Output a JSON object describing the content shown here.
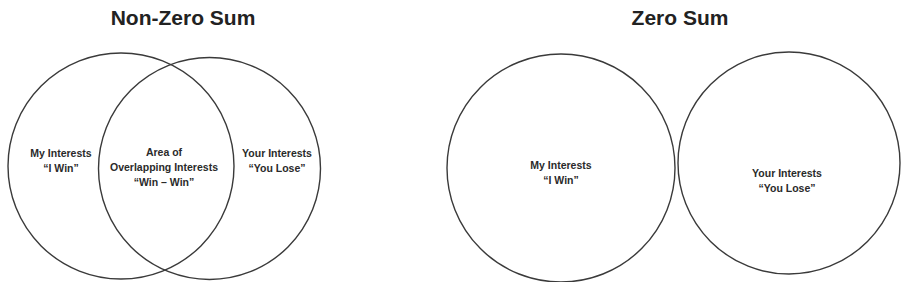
{
  "panels": [
    {
      "title": "Non-Zero Sum",
      "left_label": [
        "My Interests",
        "“I Win”"
      ],
      "overlap_label": [
        "Area of",
        "Overlapping Interests",
        "“Win – Win”"
      ],
      "right_label": [
        "Your Interests",
        "“You Lose”"
      ]
    },
    {
      "title": "Zero Sum",
      "left_label": [
        "My Interests",
        "“I Win”"
      ],
      "right_label": [
        "Your Interests",
        "“You Lose”"
      ]
    }
  ],
  "colors": {
    "stroke": "#3a3a3a",
    "background": "#ffffff",
    "text": "#222222"
  }
}
